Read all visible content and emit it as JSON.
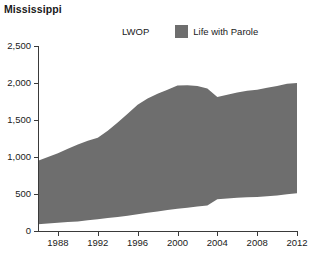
{
  "title": "Mississippi",
  "legend": {
    "position": "top-center",
    "entries": [
      {
        "label": "LWOP",
        "color": "#ffffff",
        "swatch_name": "legend-swatch-lwop"
      },
      {
        "label": "Life with Parole",
        "color": "#6e6e6e",
        "swatch_name": "legend-swatch-life-with-parole"
      }
    ]
  },
  "chart_data": {
    "type": "area",
    "stacked": true,
    "title": "Mississippi",
    "xlabel": "",
    "ylabel": "",
    "grid": false,
    "legend_position": "top-center",
    "xlim": [
      1986,
      2012
    ],
    "ylim": [
      0,
      2500
    ],
    "xticks": [
      1988,
      1992,
      1996,
      2000,
      2004,
      2008,
      2012
    ],
    "xtick_labels": [
      "1988",
      "1992",
      "1996",
      "2000",
      "2004",
      "2008",
      "2012"
    ],
    "yticks": [
      0,
      500,
      1000,
      1500,
      2000,
      2500
    ],
    "ytick_labels": [
      "0",
      "500",
      "1,000",
      "1,500",
      "2,000",
      "2,500"
    ],
    "x": [
      1986,
      1987,
      1988,
      1989,
      1990,
      1991,
      1992,
      1993,
      1994,
      1995,
      1996,
      1997,
      1998,
      1999,
      2000,
      2001,
      2002,
      2003,
      2004,
      2005,
      2006,
      2007,
      2008,
      2009,
      2010,
      2011,
      2012
    ],
    "series": [
      {
        "name": "LWOP",
        "color": "#ffffff",
        "values": [
          90,
          100,
          110,
          120,
          130,
          145,
          160,
          175,
          190,
          205,
          225,
          245,
          265,
          285,
          300,
          315,
          330,
          345,
          430,
          440,
          450,
          455,
          460,
          470,
          480,
          495,
          510
        ]
      },
      {
        "name": "Life with Parole",
        "color": "#6e6e6e",
        "values": [
          860,
          900,
          940,
          990,
          1040,
          1075,
          1100,
          1180,
          1275,
          1380,
          1480,
          1545,
          1590,
          1625,
          1665,
          1655,
          1630,
          1580,
          1380,
          1400,
          1420,
          1440,
          1450,
          1465,
          1480,
          1495,
          1490
        ]
      }
    ],
    "totals": [
      950,
      1000,
      1050,
      1110,
      1170,
      1220,
      1260,
      1355,
      1465,
      1585,
      1705,
      1790,
      1855,
      1910,
      1965,
      1970,
      1960,
      1925,
      1810,
      1840,
      1870,
      1895,
      1910,
      1935,
      1960,
      1990,
      2000
    ]
  }
}
